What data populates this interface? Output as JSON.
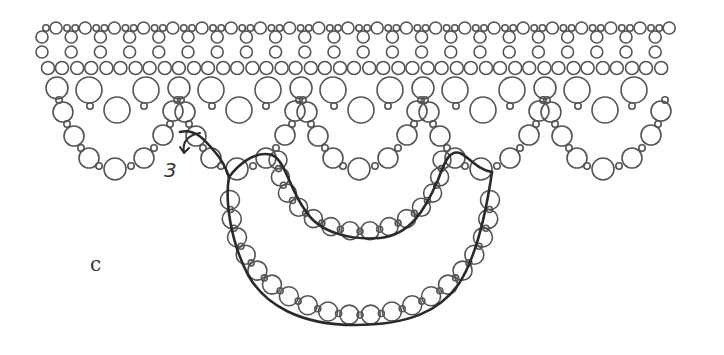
{
  "figure": {
    "panel_label": "c",
    "step_label": "3",
    "colors": {
      "bead_stroke": "#555555",
      "thread": "#2a2a2a",
      "background": "#ffffff"
    }
  },
  "beads": {
    "top_row": {
      "y": 28,
      "start_x": 46,
      "period": 29.2,
      "units": 22,
      "pattern": [
        {
          "dx": 0,
          "r": 3.2
        },
        {
          "dx": 10,
          "r": 6
        },
        {
          "dx": 21,
          "r": 3.2
        }
      ]
    },
    "vertical_pairs": {
      "y": [
        37,
        52
      ],
      "start_x": 42,
      "period": 29.2,
      "count": 22,
      "r": 6
    },
    "row3": {
      "y": 68,
      "start_x": 48,
      "period": 29.2,
      "count": 22,
      "pair_gap": 14,
      "r": 6.5
    },
    "scallops": {
      "offsets": [
        0,
        122,
        244,
        366,
        488
      ],
      "base_x": 57,
      "beads": [
        {
          "x": 0,
          "y": 88,
          "r": 11
        },
        {
          "x": 32,
          "y": 90,
          "r": 13
        },
        {
          "x": 60,
          "y": 110,
          "r": 13
        },
        {
          "x": 89,
          "y": 90,
          "r": 13
        },
        {
          "x": 33,
          "y": 106,
          "r": 3.2
        },
        {
          "x": 87,
          "y": 106,
          "r": 3.2
        },
        {
          "x": 2,
          "y": 100,
          "r": 3.2
        },
        {
          "x": 6,
          "y": 112,
          "r": 10
        },
        {
          "x": 10,
          "y": 124,
          "r": 3.2
        },
        {
          "x": 17,
          "y": 136,
          "r": 10
        },
        {
          "x": 24,
          "y": 148,
          "r": 3.2
        },
        {
          "x": 32,
          "y": 158,
          "r": 10
        },
        {
          "x": 42,
          "y": 166,
          "r": 3.2
        },
        {
          "x": 58,
          "y": 169,
          "r": 11
        },
        {
          "x": 74,
          "y": 166,
          "r": 3.2
        },
        {
          "x": 87,
          "y": 158,
          "r": 10
        },
        {
          "x": 97,
          "y": 148,
          "r": 3.2
        },
        {
          "x": 106,
          "y": 135,
          "r": 10
        },
        {
          "x": 113,
          "y": 124,
          "r": 3.2
        },
        {
          "x": 116,
          "y": 111,
          "r": 10
        },
        {
          "x": 120,
          "y": 100,
          "r": 3.2
        }
      ]
    }
  },
  "loops": {
    "inner": {
      "cx": 360,
      "cy": 160,
      "rx": 82,
      "ry": 75,
      "bead_r": 9
    },
    "outer": {
      "cx": 360,
      "cy": 200,
      "rx": 130,
      "ry": 115,
      "bead_r": 9.5
    }
  },
  "threads": {
    "inner_path": "M229,177 C238,165 255,150 272,155 C285,160 290,190 305,210 C320,235 355,240 380,238 C410,235 425,210 438,180 C445,160 450,150 460,153 C470,158 478,170 492,172",
    "outer_path": "M229,177 C225,200 230,240 248,275 C265,305 300,325 355,325 C410,325 440,310 458,285 C475,260 485,220 492,172",
    "entry_path": "M180,132 C195,128 205,140 215,152 C222,160 226,168 229,177",
    "arrow_path": "M200,133 C188,135 182,142 184,152 M180,147 L184,153 L189,148"
  }
}
